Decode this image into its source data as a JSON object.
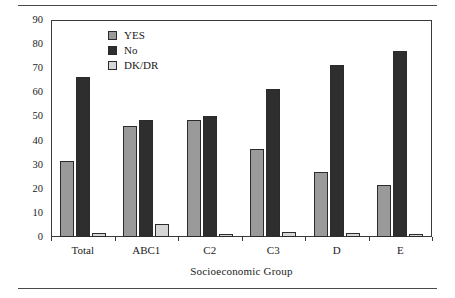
{
  "chart_data": {
    "type": "bar",
    "title": "",
    "xlabel": "Socioeconomic Group",
    "ylabel": "Percentage",
    "categories": [
      "Total",
      "ABC1",
      "C2",
      "C3",
      "D",
      "E"
    ],
    "series": [
      {
        "name": "YES",
        "color": "#9a9a9a",
        "values": [
          31.5,
          46.0,
          48.5,
          36.7,
          27.0,
          21.7
        ]
      },
      {
        "name": "No",
        "color": "#2e2e2e",
        "values": [
          66.5,
          48.5,
          50.3,
          61.5,
          71.5,
          77.3
        ]
      },
      {
        "name": "DK/DR",
        "color": "#d6d6d6",
        "values": [
          1.5,
          5.5,
          1.3,
          2.0,
          1.7,
          1.3
        ]
      }
    ],
    "ylim": [
      0,
      90
    ],
    "yticks": [
      0,
      10,
      20,
      30,
      40,
      50,
      60,
      70,
      80,
      90
    ],
    "ytick_labels": [
      "0",
      "10",
      "20",
      "30",
      "40",
      "50",
      "60",
      "70",
      "80",
      "90"
    ],
    "grid": false,
    "legend_position": "upper-left-inside",
    "legend": [
      "YES",
      "No",
      "DK/DR"
    ]
  },
  "axes": {
    "y_title": "Percentage",
    "x_title": "Socioeconomic Group"
  },
  "legend": {
    "entries": [
      {
        "label": "YES"
      },
      {
        "label": "No"
      },
      {
        "label": "DK/DR"
      }
    ]
  }
}
